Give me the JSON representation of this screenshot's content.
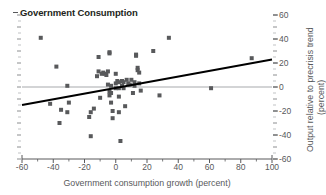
{
  "chart_data": {
    "type": "scatter",
    "title": "Government Consumption",
    "xlabel": "Government consumption growth (percent)",
    "ylabel_line1": "Output relative to precrisis trend",
    "ylabel_line2": "(percent)",
    "xlim": [
      -60,
      100
    ],
    "ylim": [
      -60,
      60
    ],
    "xticks": [
      -60,
      -40,
      -20,
      0,
      20,
      40,
      60,
      80,
      100
    ],
    "xtick_labels": [
      "-60",
      "-40",
      "-20",
      "0",
      "20",
      "40",
      "60",
      "80",
      "100"
    ],
    "yticks": [
      -60,
      -40,
      -20,
      0,
      20,
      40,
      60
    ],
    "ytick_labels": [
      "-60",
      "-40",
      "-20",
      "0",
      "20",
      "40",
      "60"
    ],
    "y_minor_tick_step": 10,
    "x_minor_tick_step": 10,
    "grid": false,
    "zero_line": true,
    "zero_line_color": "#a7a9ac",
    "y_axis_position": "right",
    "legend": null,
    "marker": "square",
    "marker_color": "#58595b",
    "marker_size": 4,
    "trendline": {
      "label": "fitted regression line",
      "color": "#000000",
      "width": 2,
      "x_start": -60,
      "y_start": -15,
      "x_end": 100,
      "y_end": 23,
      "slope": 0.2375,
      "intercept": -0.75
    },
    "points": [
      [
        -48,
        41
      ],
      [
        -38,
        17
      ],
      [
        -42,
        -14
      ],
      [
        -35,
        -19
      ],
      [
        -36,
        -30
      ],
      [
        -31,
        1
      ],
      [
        -30,
        -13
      ],
      [
        -31,
        -21
      ],
      [
        -16,
        -21
      ],
      [
        -17,
        -25
      ],
      [
        -14,
        -18
      ],
      [
        -16,
        -41
      ],
      [
        -11,
        25
      ],
      [
        -11,
        13
      ],
      [
        -12,
        9
      ],
      [
        -10,
        -9
      ],
      [
        -9,
        11
      ],
      [
        -8,
        12
      ],
      [
        -7,
        11
      ],
      [
        -6,
        10
      ],
      [
        -5,
        13
      ],
      [
        -5,
        2
      ],
      [
        -4,
        28
      ],
      [
        -4,
        29
      ],
      [
        -4,
        -4
      ],
      [
        -4,
        -7
      ],
      [
        -3,
        1
      ],
      [
        -3,
        -5
      ],
      [
        -3,
        -13
      ],
      [
        -2,
        -20
      ],
      [
        -2,
        -26
      ],
      [
        0,
        11
      ],
      [
        0,
        3
      ],
      [
        0,
        -1
      ],
      [
        1,
        5
      ],
      [
        2,
        4
      ],
      [
        2,
        -1
      ],
      [
        2,
        -8
      ],
      [
        2,
        -21
      ],
      [
        3,
        -45
      ],
      [
        4,
        5
      ],
      [
        4,
        1
      ],
      [
        5,
        4
      ],
      [
        5,
        -1
      ],
      [
        6,
        -16
      ],
      [
        7,
        6
      ],
      [
        8,
        3
      ],
      [
        9,
        2
      ],
      [
        10,
        6
      ],
      [
        11,
        -5
      ],
      [
        12,
        4
      ],
      [
        12,
        1
      ],
      [
        13,
        27
      ],
      [
        13,
        26
      ],
      [
        14,
        16
      ],
      [
        14,
        14
      ],
      [
        15,
        12
      ],
      [
        15,
        3
      ],
      [
        16,
        -3
      ],
      [
        24,
        30
      ],
      [
        28,
        -7
      ],
      [
        34,
        41
      ],
      [
        61,
        -1
      ],
      [
        87,
        24
      ]
    ]
  }
}
